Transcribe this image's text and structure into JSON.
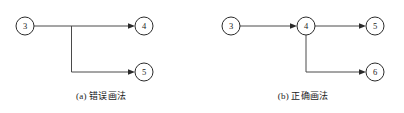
{
  "figure": {
    "background_color": "#ffffff",
    "line_color": "#4a4a4a",
    "node_stroke_color": "#2b2b2b",
    "text_color": "#1a1a1a",
    "panels": [
      {
        "key": "a",
        "caption": "(a) 错误画法",
        "nodes": [
          {
            "id": "a-node-3",
            "label": "3",
            "cx": 25,
            "cy": 26,
            "r": 9
          },
          {
            "id": "a-node-4",
            "label": "4",
            "cx": 144,
            "cy": 26,
            "r": 9
          },
          {
            "id": "a-node-5",
            "label": "5",
            "cx": 144,
            "cy": 72,
            "r": 9
          }
        ],
        "edges": [
          {
            "id": "a-edge-3-4",
            "from": "3",
            "to": "4",
            "kind": "straight-horizontal"
          },
          {
            "id": "a-edge-mid-5",
            "from": "mid-line-branch",
            "to": "5",
            "kind": "elbow-down-right"
          }
        ]
      },
      {
        "key": "b",
        "caption": "(b) 正确画法",
        "nodes": [
          {
            "id": "b-node-3",
            "label": "3",
            "cx": 231,
            "cy": 26,
            "r": 9
          },
          {
            "id": "b-node-4",
            "label": "4",
            "cx": 306,
            "cy": 26,
            "r": 9
          },
          {
            "id": "b-node-5",
            "label": "5",
            "cx": 375,
            "cy": 26,
            "r": 9
          },
          {
            "id": "b-node-6",
            "label": "6",
            "cx": 375,
            "cy": 72,
            "r": 9
          }
        ],
        "edges": [
          {
            "id": "b-edge-3-4",
            "from": "3",
            "to": "4",
            "kind": "straight-horizontal"
          },
          {
            "id": "b-edge-4-5",
            "from": "4",
            "to": "5",
            "kind": "straight-horizontal"
          },
          {
            "id": "b-edge-4-6",
            "from": "4",
            "to": "6",
            "kind": "elbow-down-right"
          }
        ]
      }
    ]
  }
}
